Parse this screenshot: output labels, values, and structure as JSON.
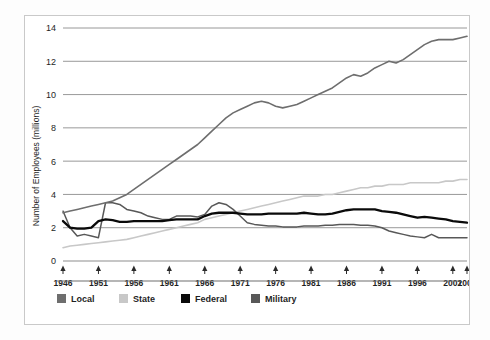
{
  "figure": {
    "background_color": "#fdfdfd",
    "frame_color": "#c9c9c9"
  },
  "chart_data": {
    "type": "line",
    "title": "",
    "xlabel": "",
    "ylabel": "Number of Employees (millions)",
    "xlim": [
      1946,
      2003
    ],
    "ylim": [
      0,
      14
    ],
    "grid": true,
    "grid_axis": "y",
    "legend_position": "bottom",
    "x_tick_labels": [
      "1946",
      "1951",
      "1956",
      "1961",
      "1966",
      "1971",
      "1976",
      "1981",
      "1986",
      "1991",
      "1996",
      "2001",
      "2003"
    ],
    "x_ticks": [
      1946,
      1951,
      1956,
      1961,
      1966,
      1971,
      1976,
      1981,
      1986,
      1991,
      1996,
      2001,
      2003
    ],
    "y_tick_labels": [
      "0",
      "2",
      "4",
      "6",
      "8",
      "10",
      "12",
      "14"
    ],
    "y_ticks": [
      0,
      2,
      4,
      6,
      8,
      10,
      12,
      14
    ],
    "x": [
      1946,
      1947,
      1948,
      1949,
      1950,
      1951,
      1952,
      1953,
      1954,
      1955,
      1956,
      1957,
      1958,
      1959,
      1960,
      1961,
      1962,
      1963,
      1964,
      1965,
      1966,
      1967,
      1968,
      1969,
      1970,
      1971,
      1972,
      1973,
      1974,
      1975,
      1976,
      1977,
      1978,
      1979,
      1980,
      1981,
      1982,
      1983,
      1984,
      1985,
      1986,
      1987,
      1988,
      1989,
      1990,
      1991,
      1992,
      1993,
      1994,
      1995,
      1996,
      1997,
      1998,
      1999,
      2000,
      2001,
      2002,
      2003
    ],
    "series": [
      {
        "name": "Local",
        "color": "#6e6e6e",
        "width": 1.6,
        "values": [
          2.9,
          3.0,
          3.1,
          3.2,
          3.3,
          3.4,
          3.5,
          3.6,
          3.8,
          4.0,
          4.3,
          4.6,
          4.9,
          5.2,
          5.5,
          5.8,
          6.1,
          6.4,
          6.7,
          7.0,
          7.4,
          7.8,
          8.2,
          8.6,
          8.9,
          9.1,
          9.3,
          9.5,
          9.6,
          9.5,
          9.3,
          9.2,
          9.3,
          9.4,
          9.6,
          9.8,
          10.0,
          10.2,
          10.4,
          10.7,
          11.0,
          11.2,
          11.1,
          11.3,
          11.6,
          11.8,
          12.0,
          11.9,
          12.1,
          12.4,
          12.7,
          13.0,
          13.2,
          13.3,
          13.3,
          13.3,
          13.4,
          13.5
        ]
      },
      {
        "name": "State",
        "color": "#c8c8c8",
        "width": 1.6,
        "values": [
          0.8,
          0.9,
          0.95,
          1.0,
          1.05,
          1.1,
          1.15,
          1.2,
          1.25,
          1.3,
          1.4,
          1.5,
          1.6,
          1.7,
          1.8,
          1.9,
          2.0,
          2.1,
          2.2,
          2.3,
          2.5,
          2.6,
          2.7,
          2.8,
          2.9,
          3.0,
          3.1,
          3.2,
          3.3,
          3.4,
          3.5,
          3.6,
          3.7,
          3.8,
          3.9,
          3.9,
          3.9,
          4.0,
          4.0,
          4.1,
          4.2,
          4.3,
          4.4,
          4.4,
          4.5,
          4.5,
          4.6,
          4.6,
          4.6,
          4.7,
          4.7,
          4.7,
          4.7,
          4.7,
          4.8,
          4.8,
          4.9,
          4.9
        ]
      },
      {
        "name": "Federal",
        "color": "#0a0a0a",
        "width": 2.3,
        "values": [
          2.4,
          2.0,
          1.95,
          1.95,
          2.0,
          2.4,
          2.5,
          2.45,
          2.35,
          2.35,
          2.4,
          2.4,
          2.4,
          2.4,
          2.4,
          2.45,
          2.5,
          2.5,
          2.5,
          2.5,
          2.7,
          2.85,
          2.9,
          2.9,
          2.9,
          2.85,
          2.8,
          2.8,
          2.8,
          2.85,
          2.85,
          2.85,
          2.85,
          2.85,
          2.9,
          2.85,
          2.8,
          2.8,
          2.85,
          2.95,
          3.05,
          3.1,
          3.1,
          3.1,
          3.1,
          3.0,
          2.95,
          2.9,
          2.8,
          2.7,
          2.6,
          2.65,
          2.6,
          2.55,
          2.5,
          2.4,
          2.35,
          2.3
        ]
      },
      {
        "name": "Military",
        "color": "#585858",
        "width": 1.5,
        "values": [
          3.0,
          2.0,
          1.5,
          1.6,
          1.5,
          1.4,
          3.5,
          3.5,
          3.4,
          3.1,
          3.0,
          2.9,
          2.7,
          2.6,
          2.5,
          2.5,
          2.7,
          2.7,
          2.7,
          2.65,
          2.8,
          3.3,
          3.5,
          3.4,
          3.1,
          2.7,
          2.3,
          2.2,
          2.15,
          2.1,
          2.1,
          2.05,
          2.05,
          2.05,
          2.1,
          2.1,
          2.1,
          2.15,
          2.15,
          2.2,
          2.2,
          2.2,
          2.15,
          2.15,
          2.1,
          2.0,
          1.8,
          1.7,
          1.6,
          1.5,
          1.45,
          1.4,
          1.6,
          1.4,
          1.4,
          1.4,
          1.4,
          1.4
        ]
      }
    ],
    "legend": [
      {
        "label": "Local",
        "color": "#6e6e6e"
      },
      {
        "label": "State",
        "color": "#c8c8c8"
      },
      {
        "label": "Federal",
        "color": "#0a0a0a"
      },
      {
        "label": "Military",
        "color": "#585858"
      }
    ]
  }
}
